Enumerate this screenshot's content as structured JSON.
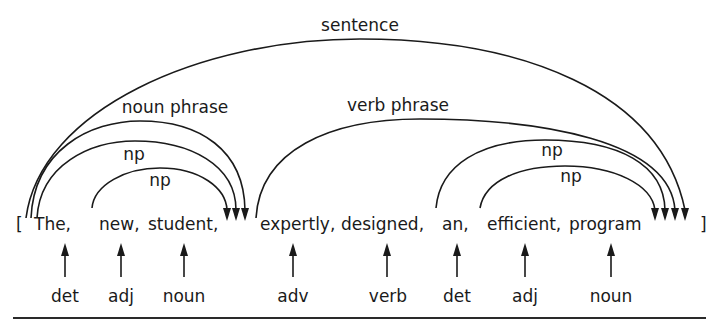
{
  "diagram": {
    "open_bracket": "[",
    "close_bracket": "]",
    "words": [
      {
        "text": "The,",
        "x": 34
      },
      {
        "text": "new,",
        "x": 99
      },
      {
        "text": "student,",
        "x": 148
      },
      {
        "text": "expertly,",
        "x": 260
      },
      {
        "text": "designed,",
        "x": 341
      },
      {
        "text": "an,",
        "x": 442
      },
      {
        "text": "efficient,",
        "x": 487
      },
      {
        "text": "program",
        "x": 569
      }
    ],
    "tags": [
      {
        "text": "det",
        "x": 65
      },
      {
        "text": "adj",
        "x": 121
      },
      {
        "text": "noun",
        "x": 183
      },
      {
        "text": "adv",
        "x": 292
      },
      {
        "text": "verb",
        "x": 388
      },
      {
        "text": "det",
        "x": 457
      },
      {
        "text": "adj",
        "x": 524
      },
      {
        "text": "noun",
        "x": 611
      }
    ],
    "arcs": [
      {
        "label": "sentence",
        "label_x": 360,
        "label_y": 15
      },
      {
        "label": "noun phrase",
        "label_x": 175,
        "label_y": 97
      },
      {
        "label": "np",
        "label_x": 134,
        "label_y": 144
      },
      {
        "label": "np",
        "label_x": 160,
        "label_y": 170
      },
      {
        "label": "verb phrase",
        "label_x": 398,
        "label_y": 95
      },
      {
        "label": "np",
        "label_x": 552,
        "label_y": 140
      },
      {
        "label": "np",
        "label_x": 571,
        "label_y": 166
      }
    ],
    "structure": {
      "sentence": [
        "noun phrase",
        "verb phrase"
      ],
      "noun phrase": [
        "np"
      ],
      "np_left_outer": [
        "det:The",
        "np_left_inner"
      ],
      "np_left_inner": [
        "adj:new",
        "noun:student"
      ],
      "verb phrase": [
        "adv:expertly",
        "verb:designed",
        "np_right_outer"
      ],
      "np_right_outer": [
        "det:an",
        "np_right_inner"
      ],
      "np_right_inner": [
        "adj:efficient",
        "noun:program"
      ]
    },
    "colors": {
      "ink": "#1a1a1a",
      "background": "#ffffff"
    }
  }
}
